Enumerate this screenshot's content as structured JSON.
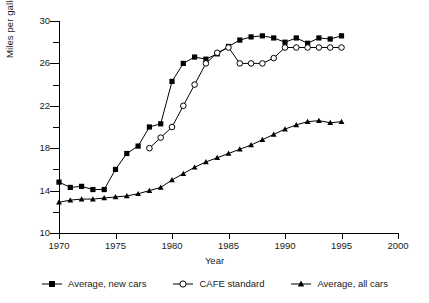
{
  "chart_data": {
    "type": "line",
    "title": "",
    "xlabel": "Year",
    "ylabel": "Miles per gallon (MPG)",
    "xlim": [
      1970,
      2000
    ],
    "ylim": [
      10,
      30
    ],
    "xticks": [
      1970,
      1975,
      1980,
      1985,
      1990,
      1995,
      2000
    ],
    "yticks": [
      10,
      14,
      18,
      22,
      26,
      30
    ],
    "yticks_minor": [
      12,
      16,
      20,
      24,
      28
    ],
    "grid": false,
    "legend_position": "bottom",
    "series": [
      {
        "name": "Average, new cars",
        "marker": "filled-square",
        "x": [
          1970,
          1971,
          1972,
          1973,
          1974,
          1975,
          1976,
          1977,
          1978,
          1979,
          1980,
          1981,
          1982,
          1983,
          1984,
          1985,
          1986,
          1987,
          1988,
          1989,
          1990,
          1991,
          1992,
          1993,
          1994,
          1995
        ],
        "values": [
          14.8,
          14.3,
          14.4,
          14.1,
          14.1,
          16.0,
          17.5,
          18.2,
          20.0,
          20.3,
          24.3,
          26.0,
          26.6,
          26.4,
          26.9,
          27.6,
          28.2,
          28.5,
          28.6,
          28.4,
          28.0,
          28.4,
          27.9,
          28.4,
          28.3,
          28.6
        ]
      },
      {
        "name": "CAFE standard",
        "marker": "open-circle",
        "x": [
          1978,
          1979,
          1980,
          1981,
          1982,
          1983,
          1984,
          1985,
          1986,
          1987,
          1988,
          1989,
          1990,
          1991,
          1992,
          1993,
          1994,
          1995
        ],
        "values": [
          18.0,
          19.0,
          20.0,
          22.0,
          24.0,
          26.0,
          27.0,
          27.5,
          26.0,
          26.0,
          26.0,
          26.5,
          27.5,
          27.5,
          27.5,
          27.5,
          27.5,
          27.5
        ]
      },
      {
        "name": "Average, all cars",
        "marker": "filled-triangle",
        "x": [
          1970,
          1971,
          1972,
          1973,
          1974,
          1975,
          1976,
          1977,
          1978,
          1979,
          1980,
          1981,
          1982,
          1983,
          1984,
          1985,
          1986,
          1987,
          1988,
          1989,
          1990,
          1991,
          1992,
          1993,
          1994,
          1995
        ],
        "values": [
          12.9,
          13.1,
          13.2,
          13.2,
          13.3,
          13.4,
          13.5,
          13.7,
          14.0,
          14.3,
          15.0,
          15.6,
          16.2,
          16.7,
          17.1,
          17.5,
          17.9,
          18.3,
          18.8,
          19.3,
          19.8,
          20.2,
          20.5,
          20.6,
          20.4,
          20.5
        ]
      }
    ]
  },
  "axis": {
    "y_title": "Miles per gallon (MPG)",
    "x_title": "Year",
    "y_labels": [
      "30",
      "26",
      "22",
      "18",
      "14",
      "10"
    ],
    "x_labels": [
      "1970",
      "1975",
      "1980",
      "1985",
      "1990",
      "1995",
      "2000"
    ]
  },
  "legend": {
    "items": [
      {
        "label": "Average, new cars",
        "marker": "filled-square"
      },
      {
        "label": "CAFE standard",
        "marker": "open-circle"
      },
      {
        "label": "Average, all cars",
        "marker": "filled-triangle"
      }
    ]
  }
}
